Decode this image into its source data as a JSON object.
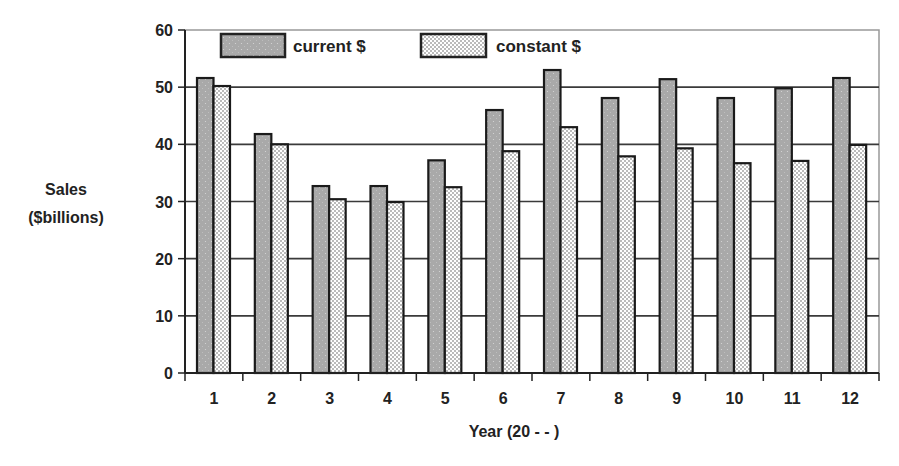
{
  "chart_data": {
    "type": "bar",
    "title": "",
    "xlabel": "Year (20 - - )",
    "ylabel": "Sales ($billions)",
    "ylabel_lines": [
      "Sales",
      "($billions)"
    ],
    "categories": [
      "1",
      "2",
      "3",
      "4",
      "5",
      "6",
      "7",
      "8",
      "9",
      "10",
      "11",
      "12"
    ],
    "series": [
      {
        "name": "current $",
        "values": [
          51.6,
          41.8,
          32.7,
          32.7,
          37.2,
          46.0,
          53.0,
          48.1,
          51.4,
          48.1,
          49.8,
          51.6
        ]
      },
      {
        "name": "constant $",
        "values": [
          50.2,
          40.0,
          30.4,
          29.9,
          32.5,
          38.8,
          43.0,
          37.9,
          39.3,
          36.7,
          37.1,
          39.9
        ]
      }
    ],
    "ylim": [
      0,
      60
    ],
    "yticks": [
      0,
      10,
      20,
      30,
      40,
      50,
      60
    ],
    "grid": true,
    "legend_position": "top-inside",
    "colors": {
      "current": "#a9a9a9",
      "constant_bg": "#ffffff",
      "constant_dots": "#555555",
      "grid": "#3a3a3a",
      "border": "#999999"
    }
  }
}
